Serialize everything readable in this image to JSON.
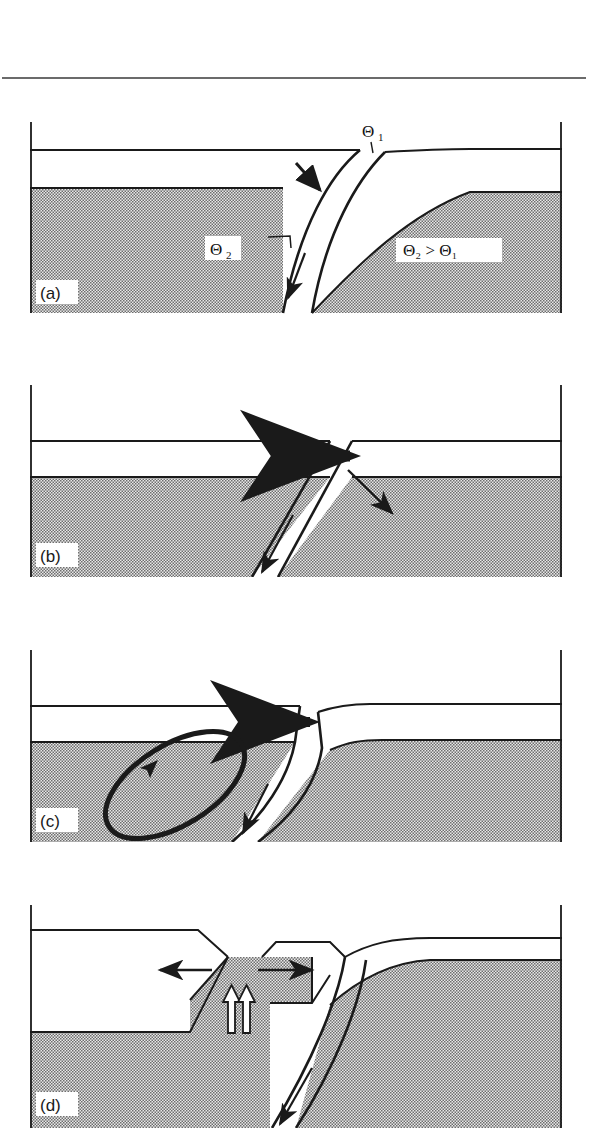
{
  "figure": {
    "kind": "geological-cross-section-diagram",
    "panel_count": 4,
    "top_rule": true,
    "background_color": "#ffffff",
    "ink_color": "#1a1a1a",
    "shading_color": "#9c9c9c",
    "shading_style": "fine-checkerboard-stipple"
  },
  "panels": [
    {
      "id": "a",
      "label": "(a)",
      "caption_labels": {
        "theta1": "Θ",
        "theta1_sub": "1",
        "theta2": "Θ",
        "theta2_sub": "2",
        "inequality": "Θ₂ > Θ₁"
      },
      "fault_type": "listric-normal-fault",
      "description": "Curved listric fault with shallow dip Theta1 at surface steepening to Theta2 at depth",
      "annotations": [
        "theta1-angle-label",
        "theta2-angle-label",
        "inequality-label",
        "hanging-wall-slip-arrow",
        "downdip-slip-arrow"
      ]
    },
    {
      "id": "b",
      "label": "(b)",
      "fault_type": "planar-normal-fault",
      "description": "Planar fault with rigid-body translation of hanging wall, no rotation",
      "annotations": [
        "horizontal-translation-arrow",
        "hanging-wall-displacement-arrow",
        "downdip-slip-arrow"
      ]
    },
    {
      "id": "c",
      "label": "(c)",
      "fault_type": "listric-fault-with-rotation",
      "description": "Listric fault with hanging wall rotation shown by elliptical rotation loop",
      "annotations": [
        "horizontal-translation-arrow",
        "rotation-ellipse",
        "downdip-slip-arrow"
      ]
    },
    {
      "id": "d",
      "label": "(d)",
      "fault_type": "listric-fault-with-graben-collapse",
      "description": "Listric fault with crestal collapse graben, extension arrows and vertical uplift arrows",
      "annotations": [
        "extension-arrow-left",
        "extension-arrow-right",
        "uplift-arrow-pair",
        "downdip-slip-arrow"
      ]
    }
  ]
}
